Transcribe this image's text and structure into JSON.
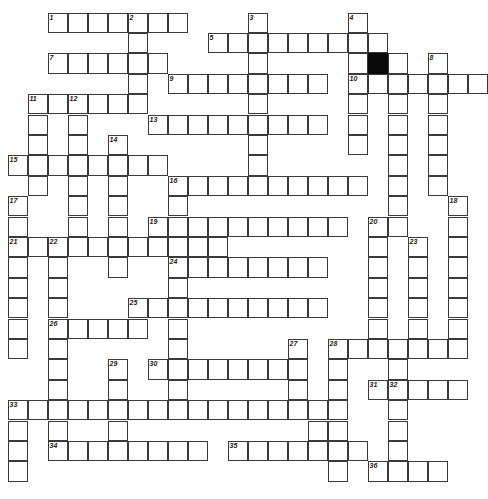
{
  "puzzle": {
    "type": "crossword",
    "cell_size": 20,
    "origin": {
      "x": 8,
      "y": 13
    },
    "row_height": 20.4,
    "colors": {
      "line": "#3a3a3a",
      "block": "#0a0a0a",
      "background": "#ffffff"
    },
    "rows": [
      {
        "r": 0,
        "cols": [
          2,
          3,
          4,
          5,
          6,
          7,
          8,
          12,
          17
        ]
      },
      {
        "r": 1,
        "cols": [
          6,
          10,
          11,
          12,
          13,
          14,
          15,
          16,
          17,
          18
        ]
      },
      {
        "r": 2,
        "cols": [
          2,
          3,
          4,
          5,
          6,
          7,
          12,
          17,
          19,
          21
        ],
        "black": [
          18
        ]
      },
      {
        "r": 3,
        "cols": [
          6,
          8,
          9,
          10,
          11,
          12,
          13,
          14,
          15,
          17,
          18,
          19,
          20,
          21,
          22,
          23
        ]
      },
      {
        "r": 4,
        "cols": [
          1,
          2,
          3,
          4,
          5,
          6,
          12,
          17,
          19,
          21
        ]
      },
      {
        "r": 5,
        "cols": [
          1,
          3,
          7,
          8,
          9,
          10,
          11,
          12,
          13,
          14,
          15,
          17,
          19,
          21
        ]
      },
      {
        "r": 6,
        "cols": [
          1,
          3,
          5,
          12,
          17,
          19,
          21
        ]
      },
      {
        "r": 7,
        "cols": [
          0,
          1,
          2,
          3,
          4,
          5,
          6,
          7,
          12,
          19,
          21
        ]
      },
      {
        "r": 8,
        "cols": [
          1,
          3,
          5,
          8,
          9,
          10,
          11,
          12,
          13,
          14,
          15,
          16,
          17,
          19,
          21
        ]
      },
      {
        "r": 9,
        "cols": [
          0,
          3,
          5,
          8,
          19,
          22
        ]
      },
      {
        "r": 10,
        "cols": [
          0,
          3,
          5,
          7,
          8,
          9,
          10,
          11,
          12,
          13,
          14,
          15,
          16,
          18,
          19,
          22
        ]
      },
      {
        "r": 11,
        "cols": [
          0,
          1,
          2,
          3,
          4,
          5,
          6,
          7,
          8,
          9,
          10,
          18,
          20,
          22
        ]
      },
      {
        "r": 12,
        "cols": [
          0,
          2,
          5,
          8,
          9,
          10,
          11,
          12,
          13,
          14,
          15,
          18,
          20,
          22
        ]
      },
      {
        "r": 13,
        "cols": [
          0,
          2,
          8,
          18,
          20,
          22
        ]
      },
      {
        "r": 14,
        "cols": [
          0,
          2,
          6,
          7,
          8,
          9,
          10,
          11,
          12,
          13,
          14,
          15,
          18,
          20,
          22
        ]
      },
      {
        "r": 15,
        "cols": [
          0,
          2,
          3,
          4,
          5,
          6,
          8,
          18,
          20,
          22
        ]
      },
      {
        "r": 16,
        "cols": [
          0,
          2,
          8,
          14,
          16,
          17,
          18,
          19,
          20,
          21,
          22
        ]
      },
      {
        "r": 17,
        "cols": [
          2,
          5,
          7,
          8,
          9,
          10,
          11,
          12,
          13,
          14,
          16,
          19
        ]
      },
      {
        "r": 18,
        "cols": [
          2,
          5,
          8,
          14,
          16,
          18,
          19,
          20,
          21,
          22
        ]
      },
      {
        "r": 19,
        "cols": [
          0,
          1,
          2,
          3,
          4,
          5,
          6,
          7,
          8,
          9,
          10,
          11,
          12,
          13,
          14,
          15,
          16,
          19
        ]
      },
      {
        "r": 20,
        "cols": [
          0,
          2,
          5,
          15,
          16,
          19
        ]
      },
      {
        "r": 21,
        "cols": [
          0,
          2,
          3,
          4,
          5,
          6,
          7,
          8,
          9,
          11,
          12,
          13,
          14,
          15,
          16,
          17,
          19
        ]
      },
      {
        "r": 22,
        "cols": [
          0,
          16,
          18,
          19,
          20,
          21
        ]
      }
    ],
    "numbers": [
      {
        "n": "1",
        "r": 0,
        "c": 2
      },
      {
        "n": "2",
        "r": 0,
        "c": 6
      },
      {
        "n": "3",
        "r": 0,
        "c": 12
      },
      {
        "n": "4",
        "r": 0,
        "c": 17
      },
      {
        "n": "5",
        "r": 1,
        "c": 10
      },
      {
        "n": "6",
        "r": 1,
        "c": 19
      },
      {
        "n": "7",
        "r": 2,
        "c": 2
      },
      {
        "n": "8",
        "r": 2,
        "c": 21
      },
      {
        "n": "9",
        "r": 3,
        "c": 8
      },
      {
        "n": "10",
        "r": 3,
        "c": 17
      },
      {
        "n": "11",
        "r": 4,
        "c": 1
      },
      {
        "n": "12",
        "r": 4,
        "c": 3
      },
      {
        "n": "13",
        "r": 5,
        "c": 7
      },
      {
        "n": "14",
        "r": 6,
        "c": 5
      },
      {
        "n": "15",
        "r": 7,
        "c": 0
      },
      {
        "n": "16",
        "r": 8,
        "c": 8
      },
      {
        "n": "17",
        "r": 9,
        "c": 0
      },
      {
        "n": "18",
        "r": 9,
        "c": 22
      },
      {
        "n": "19",
        "r": 10,
        "c": 7
      },
      {
        "n": "20",
        "r": 10,
        "c": 18
      },
      {
        "n": "21",
        "r": 11,
        "c": 0
      },
      {
        "n": "22",
        "r": 11,
        "c": 2
      },
      {
        "n": "23",
        "r": 11,
        "c": 20
      },
      {
        "n": "24",
        "r": 12,
        "c": 8
      },
      {
        "n": "25",
        "r": 14,
        "c": 6
      },
      {
        "n": "26",
        "r": 15,
        "c": 2
      },
      {
        "n": "27",
        "r": 16,
        "c": 14
      },
      {
        "n": "28",
        "r": 16,
        "c": 16
      },
      {
        "n": "29",
        "r": 17,
        "c": 5
      },
      {
        "n": "30",
        "r": 17,
        "c": 7
      },
      {
        "n": "31",
        "r": 18,
        "c": 18
      },
      {
        "n": "32",
        "r": 18,
        "c": 19
      },
      {
        "n": "33",
        "r": 19,
        "c": 0
      },
      {
        "n": "34",
        "r": 21,
        "c": 2
      },
      {
        "n": "35",
        "r": 21,
        "c": 11
      },
      {
        "n": "36",
        "r": 22,
        "c": 18
      }
    ]
  }
}
